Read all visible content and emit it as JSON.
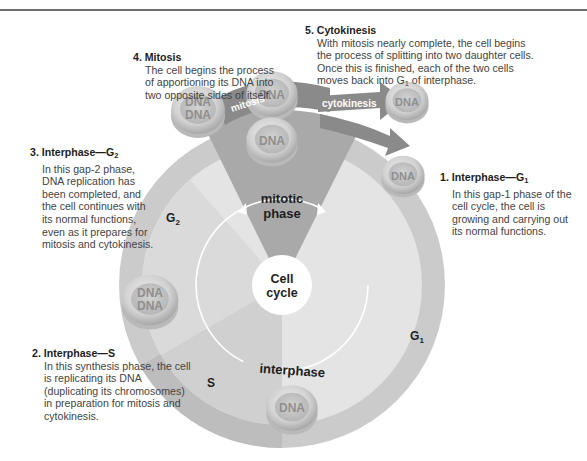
{
  "callouts": {
    "c4": {
      "num": "4.",
      "title": "Mitosis",
      "body": "The cell begins the process of apportioning its DNA into two opposite sides of itself."
    },
    "c5": {
      "num": "5.",
      "title": "Cytokinesis",
      "body_pre": "With mitosis nearly complete, the cell begins the process of splitting into two daughter cells. Once this is finished, each of the two cells moves back into G",
      "body_sub": "1",
      "body_post": " of interphase."
    },
    "c3": {
      "num": "3.",
      "title": "Interphase—G",
      "title_sub": "2",
      "body": "In this gap-2 phase, DNA replication has been completed, and the cell continues with its normal functions, even as it prepares for mitosis and cytokinesis."
    },
    "c1": {
      "num": "1.",
      "title": "Interphase—G",
      "title_sub": "1",
      "body": "In this gap-1 phase of the cell cycle, the cell is growing and carrying out its normal functions."
    },
    "c2": {
      "num": "2.",
      "title": "Interphase—S",
      "body": "In this synthesis phase, the cell is replicating its DNA (duplicating its chromosomes) in preparation for mitosis and cytokinesis."
    }
  },
  "diagram": {
    "center_label_1": "Cell",
    "center_label_2": "cycle",
    "mitotic_label_1": "mitotic",
    "mitotic_label_2": "phase",
    "interphase_label": "interphase",
    "g1_label": "G",
    "g1_sub": "1",
    "g2_label": "G",
    "g2_sub": "2",
    "s_label": "S",
    "arrow_mitosis": "mitosis",
    "arrow_cytokinesis": "cytokinesis",
    "dna": "DNA",
    "colors": {
      "ring_outer": "#c9c9c9",
      "ring_g1": "#e2e2e2",
      "ring_s": "#bdbdbd",
      "mitotic_wedge": "#a9a9a9",
      "arrow": "#8c8c8c",
      "cell": "#d6d6d6"
    }
  }
}
